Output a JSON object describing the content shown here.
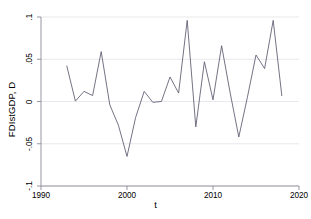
{
  "chart_data": {
    "type": "line",
    "title": "",
    "xlabel": "t",
    "ylabel": "FDIstGDP, D",
    "xlim": [
      1990,
      2020
    ],
    "ylim": [
      -0.1,
      0.1
    ],
    "xticks": [
      1990,
      2000,
      2010,
      2020
    ],
    "xticklabels": [
      "1990",
      "2000",
      "2010",
      "2020"
    ],
    "yticks": [
      -0.1,
      -0.05,
      0,
      0.05,
      0.1
    ],
    "yticklabels": [
      "-.1",
      "-.05",
      "0",
      ".05",
      ".1"
    ],
    "grid": "horizontal",
    "legend": "none",
    "line_color": "#5a5a6e",
    "x": [
      1993,
      1994,
      1995,
      1996,
      1997,
      1998,
      1999,
      2000,
      2001,
      2002,
      2003,
      2004,
      2005,
      2006,
      2007,
      2008,
      2009,
      2010,
      2011,
      2012,
      2013,
      2014,
      2015,
      2016,
      2017,
      2018
    ],
    "values": [
      0.042,
      0.0005,
      0.012,
      0.007,
      0.059,
      -0.004,
      -0.028,
      -0.065,
      -0.019,
      0.012,
      -0.001,
      0.0,
      0.029,
      0.01,
      0.096,
      -0.03,
      0.047,
      0.002,
      0.066,
      0.01,
      -0.042,
      0.005,
      0.055,
      0.039,
      0.096,
      0.007
    ],
    "series_name": "FDIstGDP, D"
  },
  "axis": {
    "y_title": "FDIstGDP, D",
    "x_title": "t",
    "x_tick_1": "1990",
    "x_tick_2": "2000",
    "x_tick_3": "2010",
    "x_tick_4": "2020",
    "y_tick_1": ".1",
    "y_tick_2": ".05",
    "y_tick_3": "0",
    "y_tick_4": "-.05",
    "y_tick_5": "-.1"
  }
}
